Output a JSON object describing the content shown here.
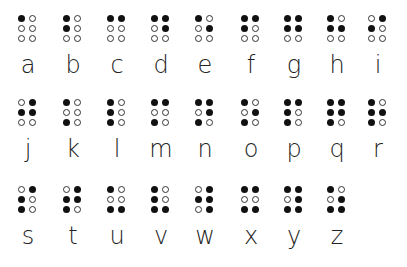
{
  "dot_order": [
    "top-left",
    "top-right",
    "middle-left",
    "middle-right",
    "bottom-left",
    "bottom-right"
  ],
  "rows": [
    [
      {
        "letter": "a",
        "dots": [
          1,
          0,
          0,
          0,
          0,
          0
        ]
      },
      {
        "letter": "b",
        "dots": [
          1,
          0,
          1,
          0,
          0,
          0
        ]
      },
      {
        "letter": "c",
        "dots": [
          1,
          1,
          0,
          0,
          0,
          0
        ]
      },
      {
        "letter": "d",
        "dots": [
          1,
          1,
          0,
          1,
          0,
          0
        ]
      },
      {
        "letter": "e",
        "dots": [
          1,
          0,
          0,
          1,
          0,
          0
        ]
      },
      {
        "letter": "f",
        "dots": [
          1,
          1,
          1,
          0,
          0,
          0
        ]
      },
      {
        "letter": "g",
        "dots": [
          1,
          1,
          1,
          1,
          0,
          0
        ]
      },
      {
        "letter": "h",
        "dots": [
          1,
          0,
          1,
          1,
          0,
          0
        ]
      },
      {
        "letter": "i",
        "dots": [
          0,
          1,
          1,
          0,
          0,
          0
        ]
      }
    ],
    [
      {
        "letter": "j",
        "dots": [
          0,
          1,
          1,
          1,
          0,
          0
        ]
      },
      {
        "letter": "k",
        "dots": [
          1,
          0,
          0,
          0,
          1,
          0
        ]
      },
      {
        "letter": "l",
        "dots": [
          1,
          0,
          1,
          0,
          1,
          0
        ]
      },
      {
        "letter": "m",
        "dots": [
          1,
          1,
          0,
          0,
          1,
          0
        ]
      },
      {
        "letter": "n",
        "dots": [
          1,
          1,
          0,
          1,
          1,
          0
        ]
      },
      {
        "letter": "o",
        "dots": [
          1,
          0,
          0,
          1,
          1,
          0
        ]
      },
      {
        "letter": "p",
        "dots": [
          1,
          1,
          1,
          0,
          1,
          0
        ]
      },
      {
        "letter": "q",
        "dots": [
          1,
          1,
          1,
          1,
          1,
          0
        ]
      },
      {
        "letter": "r",
        "dots": [
          1,
          0,
          1,
          1,
          1,
          0
        ]
      }
    ],
    [
      {
        "letter": "s",
        "dots": [
          0,
          1,
          1,
          0,
          1,
          0
        ]
      },
      {
        "letter": "t",
        "dots": [
          0,
          1,
          1,
          1,
          1,
          0
        ]
      },
      {
        "letter": "u",
        "dots": [
          1,
          0,
          0,
          0,
          1,
          1
        ]
      },
      {
        "letter": "v",
        "dots": [
          1,
          0,
          1,
          0,
          1,
          1
        ]
      },
      {
        "letter": "w",
        "dots": [
          0,
          1,
          1,
          1,
          0,
          1
        ]
      },
      {
        "letter": "x",
        "dots": [
          1,
          1,
          0,
          0,
          1,
          1
        ]
      },
      {
        "letter": "y",
        "dots": [
          1,
          1,
          0,
          1,
          1,
          1
        ]
      },
      {
        "letter": "z",
        "dots": [
          1,
          0,
          0,
          1,
          1,
          1
        ]
      }
    ]
  ],
  "layout": {
    "row_tops": [
      14,
      98,
      185
    ],
    "col_lefts": [
      13,
      58,
      102,
      146,
      190,
      236,
      279,
      322,
      363
    ]
  }
}
